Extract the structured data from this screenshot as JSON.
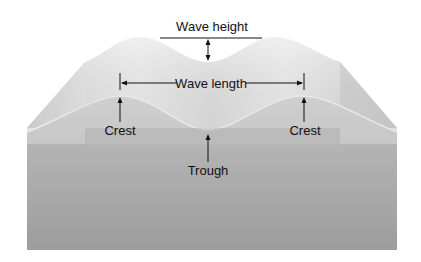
{
  "diagram": {
    "labels": {
      "wave_height": "Wave height",
      "wave_length": "Wave length",
      "crest_left": "Crest",
      "crest_right": "Crest",
      "trough": "Trough"
    },
    "colors": {
      "background": "#ffffff",
      "surface_light": "#ececec",
      "surface_mid": "#d6d6d6",
      "side_shade": "#c4c4c4",
      "front_face": "#a9a9a9",
      "front_face_dark": "#9b9b9b",
      "annotation": "#111111"
    }
  }
}
